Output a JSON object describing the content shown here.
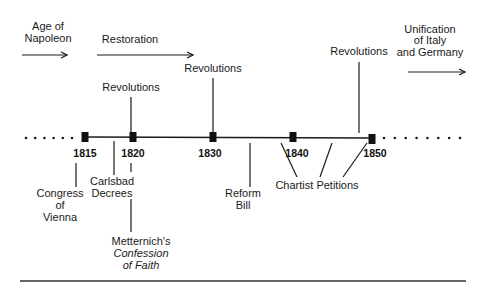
{
  "diagram": {
    "eras": [
      {
        "id": "age-of-napoleon",
        "lines": [
          "Age of",
          "Napoleon"
        ],
        "text_x": 48,
        "text_y": [
          30,
          42
        ],
        "arrow": {
          "x1": 22,
          "x2": 67,
          "y": 55
        }
      },
      {
        "id": "restoration",
        "lines": [
          "Restoration"
        ],
        "text_x": 130,
        "text_y": [
          43
        ],
        "arrow": {
          "x1": 97,
          "x2": 193,
          "y": 55
        }
      },
      {
        "id": "unification",
        "lines": [
          "Unification",
          "of Italy",
          "and Germany"
        ],
        "text_x": 430,
        "text_y": [
          33,
          44,
          56
        ],
        "arrow": {
          "x1": 408,
          "x2": 465,
          "y": 72
        }
      }
    ],
    "timeline": {
      "y": 137,
      "x_start": 85,
      "x_end": 372,
      "dots_left": {
        "from": 26,
        "to": 72,
        "count": 6
      },
      "dots_right": {
        "from": 384,
        "to": 460,
        "count": 8
      },
      "markers": [
        {
          "year": "1815",
          "x": 85,
          "label_x": 85
        },
        {
          "year": "1820",
          "x": 133,
          "label_x": 133
        },
        {
          "year": "1830",
          "x": 213,
          "label_x": 210
        },
        {
          "year": "1840",
          "x": 293,
          "label_x": 297
        },
        {
          "year": "1850",
          "x": 372,
          "label_x": 375
        }
      ]
    },
    "above_events": [
      {
        "id": "revolutions-1820",
        "label": "Revolutions",
        "x": 131,
        "text_y": 91,
        "line_top": 97,
        "line_bottom": 132
      },
      {
        "id": "revolutions-1830",
        "label": "Revolutions",
        "x": 213,
        "text_y": 72,
        "line_top": 78,
        "line_bottom": 132
      },
      {
        "id": "revolutions-1848",
        "label": "Revolutions",
        "x": 359,
        "text_y": 55,
        "line_top": 62,
        "line_bottom": 133
      }
    ],
    "below_events": [
      {
        "id": "congress-of-vienna",
        "lines": [
          "Congress",
          "of",
          "Vienna"
        ],
        "text_x": 60,
        "text_y": [
          197,
          209,
          221
        ],
        "line": {
          "x": 76,
          "y1": 163,
          "y2": 187
        }
      },
      {
        "id": "carlsbad-decrees",
        "lines": [
          "Carlsbad",
          "Decrees"
        ],
        "text_x": 112,
        "text_y": [
          185,
          197
        ],
        "line": {
          "x": 114,
          "y1": 141,
          "y2": 175
        }
      },
      {
        "id": "reform-bill",
        "lines": [
          "Reform",
          "Bill"
        ],
        "text_x": 243,
        "text_y": [
          197,
          209
        ],
        "line": {
          "x": 250,
          "y1": 143,
          "y2": 187
        }
      }
    ],
    "metternich": {
      "line": {
        "x": 131,
        "y1": 163,
        "y2": 172,
        "y3": 199,
        "y4": 232
      },
      "lines": [
        "Metternich's",
        "Confession",
        "of Faith"
      ],
      "italic": [
        false,
        true,
        true
      ],
      "text_x": 141,
      "text_y": [
        245,
        257,
        269
      ]
    },
    "chartist": {
      "label": "Chartist Petitions",
      "text_x": 317,
      "text_y": 189,
      "lines": [
        {
          "x1": 281,
          "y1": 143,
          "x2": 297,
          "y2": 177
        },
        {
          "x1": 332,
          "y1": 143,
          "x2": 320,
          "y2": 177
        },
        {
          "x1": 367,
          "y1": 143,
          "x2": 343,
          "y2": 177
        }
      ]
    },
    "bottom_rule": {
      "x1": 20,
      "x2": 466,
      "y": 281
    }
  }
}
